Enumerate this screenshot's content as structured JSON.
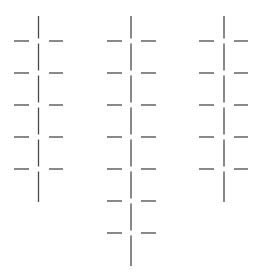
{
  "diagram": {
    "stroke_color": "#4a4a4a",
    "background": "#ffffff",
    "columns": [
      {
        "name": "column-left",
        "x": 38.5,
        "top": 16,
        "bottom": 202,
        "left_dash": [
          14,
          29
        ],
        "right_dash": [
          49,
          63
        ],
        "levels": [
          41,
          73,
          105,
          137,
          169
        ]
      },
      {
        "name": "column-middle",
        "x": 131,
        "top": 16,
        "bottom": 266,
        "left_dash": [
          107,
          122
        ],
        "right_dash": [
          141,
          156
        ],
        "levels": [
          41,
          73,
          105,
          137,
          169,
          201,
          233
        ]
      },
      {
        "name": "column-right",
        "x": 224,
        "top": 16,
        "bottom": 202,
        "left_dash": [
          199,
          214
        ],
        "right_dash": [
          234,
          248
        ],
        "levels": [
          41,
          73,
          105,
          137,
          169
        ]
      }
    ],
    "gap": 2.5
  }
}
